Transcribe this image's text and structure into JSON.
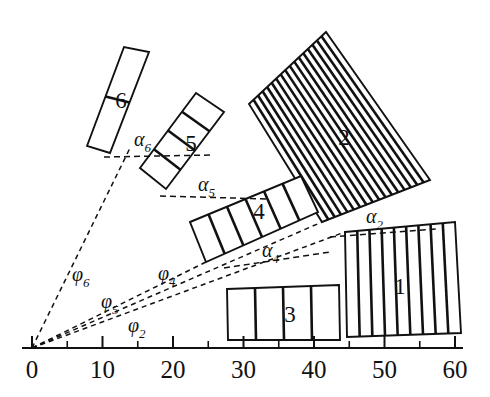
{
  "figure": {
    "title": "",
    "background": "#ffffff",
    "ink": "#111111"
  },
  "axis": {
    "name": "horizontal-scale",
    "min": 0,
    "max": 60,
    "major_step": 10,
    "minor_step": 5,
    "labels": [
      "0",
      "10",
      "20",
      "30",
      "40",
      "50",
      "60"
    ],
    "label_values": [
      0,
      10,
      20,
      30,
      40,
      50,
      60
    ],
    "y_pixel": 348,
    "x_pixel_at_min": 32,
    "x_pixel_at_max": 455,
    "tick_values": [
      0,
      5,
      10,
      15,
      20,
      25,
      30,
      35,
      40,
      45,
      50,
      55,
      60
    ]
  },
  "origin": {
    "label": "0",
    "x": 32,
    "y": 348
  },
  "sectors": [
    {
      "id": "sector-1",
      "label": "1",
      "slats": 9,
      "label_x": 400,
      "label_y": 289,
      "note": "large near-horizontal block at right, radial slats"
    },
    {
      "id": "sector-2",
      "label": "2",
      "slats": 17,
      "label_x": 344,
      "label_y": 140,
      "note": "large fan-shaped block, upper right, steeply inclined slats"
    },
    {
      "id": "sector-3",
      "label": "3",
      "slats": 4,
      "label_x": 290,
      "label_y": 317,
      "note": "flat block along the axis between 28 and 43"
    },
    {
      "id": "sector-4",
      "label": "4",
      "slats": 6,
      "label_x": 259,
      "label_y": 214,
      "note": "inclined block, middle"
    },
    {
      "id": "sector-5",
      "label": "5",
      "slats": 4,
      "label_x": 191,
      "label_y": 146,
      "note": "narrow steeply inclined block"
    },
    {
      "id": "sector-6",
      "label": "6",
      "slats": 2,
      "label_x": 121,
      "label_y": 103,
      "note": "narrowest, most steeply inclined block, top left"
    }
  ],
  "tilt_angles": [
    {
      "id": "alpha-2",
      "symbol": "α",
      "subscript": "2",
      "x": 366,
      "y": 223
    },
    {
      "id": "alpha-4",
      "symbol": "α",
      "subscript": "4",
      "x": 262,
      "y": 257
    },
    {
      "id": "alpha-5",
      "symbol": "α",
      "subscript": "5",
      "x": 198,
      "y": 191
    },
    {
      "id": "alpha-6",
      "symbol": "α",
      "subscript": "6",
      "x": 134,
      "y": 146
    }
  ],
  "polar_angles": [
    {
      "id": "phi-2",
      "symbol": "φ",
      "subscript": "2",
      "x": 128,
      "y": 332
    },
    {
      "id": "phi-4",
      "symbol": "φ",
      "subscript": "4",
      "x": 158,
      "y": 280
    },
    {
      "id": "phi-5",
      "symbol": "φ",
      "subscript": "5",
      "x": 101,
      "y": 308
    },
    {
      "id": "phi-6",
      "symbol": "φ",
      "subscript": "6",
      "x": 72,
      "y": 281
    }
  ]
}
